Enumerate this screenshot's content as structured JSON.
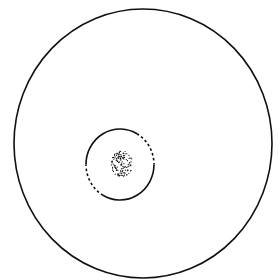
{
  "diagram": {
    "background": "#ffffff",
    "stroke_color": "#111111",
    "outer_circle": {
      "cx": 143,
      "cy": 143.5,
      "rx": 129,
      "ry": 134.5,
      "stroke_width": 1.6
    },
    "inner_circle": {
      "cx": 120,
      "cy": 164.5,
      "rx": 34,
      "ry": 35.5,
      "stroke_width": 1.6,
      "solid_arcs_deg": [
        [
          0,
          120
        ],
        [
          180,
          300
        ]
      ],
      "dashed_arcs_deg": [
        [
          300,
          360
        ],
        [
          120,
          180
        ]
      ]
    },
    "dot_cluster": {
      "cx": 122,
      "cy": 164,
      "rx": 11,
      "ry": 13,
      "count": 140,
      "dot_radius": 0.6
    }
  }
}
